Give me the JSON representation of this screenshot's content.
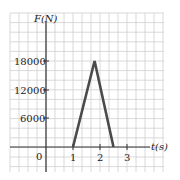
{
  "chart_data": {
    "type": "line",
    "title": "",
    "xlabel": "t(s)",
    "ylabel": "F(N)",
    "x": [
      1,
      1.8,
      2.5
    ],
    "series": [
      {
        "name": "F",
        "values": [
          0,
          18000,
          0
        ]
      }
    ],
    "xticks": [
      "0",
      "1",
      "2",
      "3"
    ],
    "yticks": [
      "6000",
      "12000",
      "18000"
    ],
    "xlim": [
      -1.3,
      3.4
    ],
    "ylim": [
      -4500,
      28000
    ],
    "grid": true,
    "line_color": "#4a4a4a",
    "grid_color": "#c8c8c8"
  },
  "labels": {
    "y_axis": "F(N)",
    "x_axis": "t(s)",
    "origin": "0",
    "x1": "1",
    "x2": "2",
    "x3": "3",
    "y1": "6000",
    "y2": "12000",
    "y3": "18000"
  }
}
